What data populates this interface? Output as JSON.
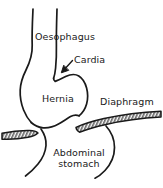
{
  "figure": {
    "background_color": "#ffffff",
    "stroke_color": "#1a1a1a",
    "text_color": "#1a1a1a",
    "width": 163,
    "height": 188
  },
  "labels": {
    "oesophagus": "Oesophagus",
    "cardia": "Cardia",
    "hernia": "Hernia",
    "diaphragm": "Diaphragm",
    "abdominal_stomach": "Abdominal stomach"
  },
  "parts": {
    "oesophagus_tube": "oesophagus-tube",
    "hernia_sac": "hernia-sac",
    "cardia_notch": "cardia-notch",
    "diaphragm_band_left": "diaphragm-band-left",
    "diaphragm_band_right": "diaphragm-band-right",
    "abdominal_stomach_outline": "abdominal-stomach-outline",
    "cardia_pointer": "cardia-leader-arrow"
  }
}
